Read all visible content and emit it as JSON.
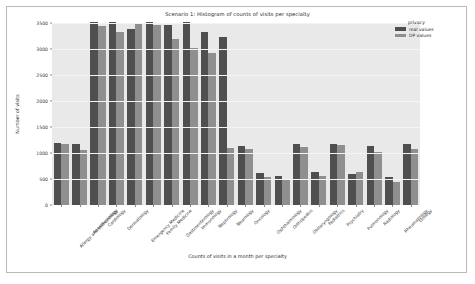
{
  "chart_data": {
    "type": "bar",
    "title": "Scenario 1: Histogram of counts of visits per specialty",
    "xlabel": "Counts of visits in a month per specialty",
    "ylabel": "Number of visits",
    "ylim": [
      0,
      3500
    ],
    "yticks": [
      0,
      500,
      1000,
      1500,
      2000,
      2500,
      3000,
      3500
    ],
    "grid": true,
    "legend_position": "upper right",
    "legend_title": "privacy",
    "categories": [
      "Allergy and Immunology",
      "Anesthesiology",
      "Cardiology",
      "Dermatology",
      "Emergency Medicine",
      "Family Medicine",
      "Gastroenterology",
      "Immunology",
      "Nephrology",
      "Neurology",
      "Oncology",
      "Ophthalmology",
      "Orthopedics",
      "Otolaryngology",
      "Pediatrics",
      "Psychiatry",
      "Pulmonology",
      "Radiology",
      "Rheumatology",
      "Urology"
    ],
    "series": [
      {
        "name": "real values",
        "color": "#4f4f4f",
        "values": [
          1190,
          1170,
          3520,
          3520,
          3380,
          3520,
          3470,
          3520,
          3330,
          3230,
          1130,
          620,
          560,
          1180,
          640,
          1180,
          590,
          1140,
          540,
          1180
        ]
      },
      {
        "name": "DP values",
        "color": "#8f8f8f",
        "values": [
          1180,
          1060,
          3440,
          3320,
          3480,
          3470,
          3190,
          3010,
          2930,
          1090,
          1080,
          540,
          480,
          1110,
          560,
          1150,
          640,
          1020,
          450,
          1070
        ]
      }
    ]
  },
  "legend": {
    "title": "privacy",
    "entries": [
      {
        "label": "real values",
        "key": "real"
      },
      {
        "label": "DP values",
        "key": "dp"
      }
    ]
  }
}
